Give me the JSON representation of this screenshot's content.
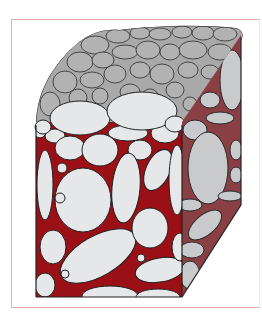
{
  "diagram": {
    "frame_color": "#f0a8aa",
    "colors": {
      "top_surface": "#a9a9a9",
      "top_grain": "#b4b4b4",
      "grain_light": "#e6e7e8",
      "side_face": "#c3c4c6",
      "side_grain": "#cfd0d2",
      "matrix": "#9b1016",
      "side_matrix": "#8a3f44",
      "outline": "#2a2a2a"
    },
    "faces": [
      "top (rounded pebbles)",
      "front (grains in red matrix)",
      "right side (shaded grains)"
    ]
  }
}
